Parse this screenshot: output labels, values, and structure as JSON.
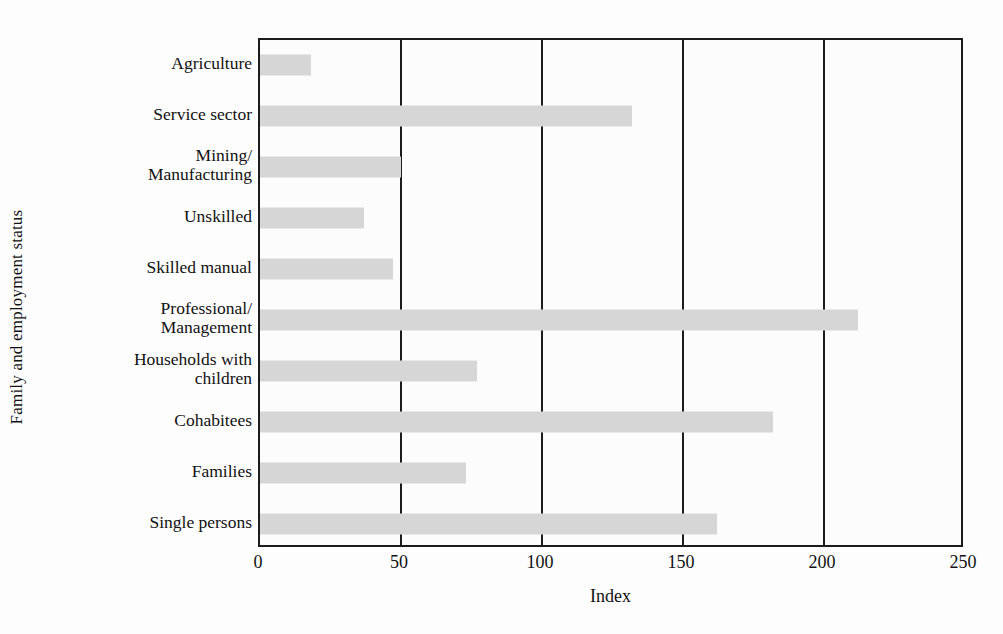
{
  "chart_data": {
    "type": "bar",
    "orientation": "horizontal",
    "title": "",
    "xlabel": "Index",
    "ylabel": "Family and employment status",
    "xlim": [
      0,
      250
    ],
    "xticks": [
      0,
      50,
      100,
      150,
      200,
      250
    ],
    "xtick_labels": [
      "0",
      "50",
      "100",
      "150",
      "200",
      "250"
    ],
    "gridlines_x": [
      50,
      100,
      150,
      200
    ],
    "grid": true,
    "legend": null,
    "bar_color": "#d6d6d6",
    "axis_color": "#1c1c1c",
    "background_color": "#fcfcfc",
    "categories": [
      "Agriculture",
      "Service sector",
      "Mining/\nManufacturing",
      "Unskilled",
      "Skilled manual",
      "Professional/\nManagement",
      "Households with\nchildren",
      "Cohabitees",
      "Families",
      "Single persons"
    ],
    "values": [
      18,
      132,
      50,
      37,
      47,
      212,
      77,
      182,
      73,
      162
    ]
  }
}
